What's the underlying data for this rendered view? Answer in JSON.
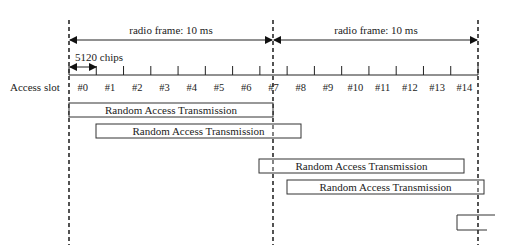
{
  "diagram": {
    "frames": [
      {
        "label": "radio frame: 10 ms",
        "x1": 69,
        "x2": 273
      },
      {
        "label": "radio frame: 10 ms",
        "x1": 273,
        "x2": 478
      }
    ],
    "chip_label": "5120 chips",
    "row_label": "Access slot",
    "slots": [
      "#0",
      "#1",
      "#2",
      "#3",
      "#4",
      "#5",
      "#6",
      "#7",
      "#8",
      "#9",
      "#10",
      "#11",
      "#12",
      "#13",
      "#14"
    ],
    "transmissions": [
      {
        "label": "Random Access Transmission",
        "x": 69,
        "y": 103,
        "w": 204,
        "h": 14
      },
      {
        "label": "Random Access Transmission",
        "x": 96,
        "y": 124,
        "w": 205,
        "h": 14
      },
      {
        "label": "Random Access Transmission",
        "x": 259,
        "y": 159,
        "w": 205,
        "h": 14
      },
      {
        "label": "Random Access Transmission",
        "x": 287,
        "y": 180,
        "w": 197,
        "h": 14
      }
    ],
    "partial_box": {
      "x": 457,
      "y": 215,
      "w": 38,
      "h": 15
    },
    "dashed_lines_x": [
      69,
      273,
      478
    ],
    "colors": {
      "line": "#222222",
      "dash": "#333333",
      "background": "#ffffff"
    }
  }
}
